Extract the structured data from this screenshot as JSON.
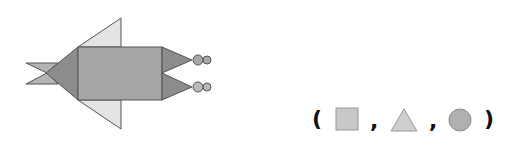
{
  "figure": {
    "colors": {
      "rectangle": "#a6a6a6",
      "dark_triangle": "#8c8c8c",
      "light_triangle": "#e4e4e4",
      "tail_triangle": "#b4b4b4",
      "circle": "#a9a9a9",
      "stroke": "#555555"
    },
    "counts": {
      "rectangles": 1,
      "triangles": 7,
      "circles": 4
    }
  },
  "answer": {
    "open_paren": "(",
    "comma_1": ",",
    "comma_2": ",",
    "close_paren": ")",
    "shapes": [
      "square-icon",
      "triangle-icon",
      "circle-icon"
    ],
    "colors": {
      "square": "#c8c8c8",
      "triangle": "#cfcfcf",
      "circle": "#b0b0b0",
      "stroke": "#888888"
    }
  }
}
